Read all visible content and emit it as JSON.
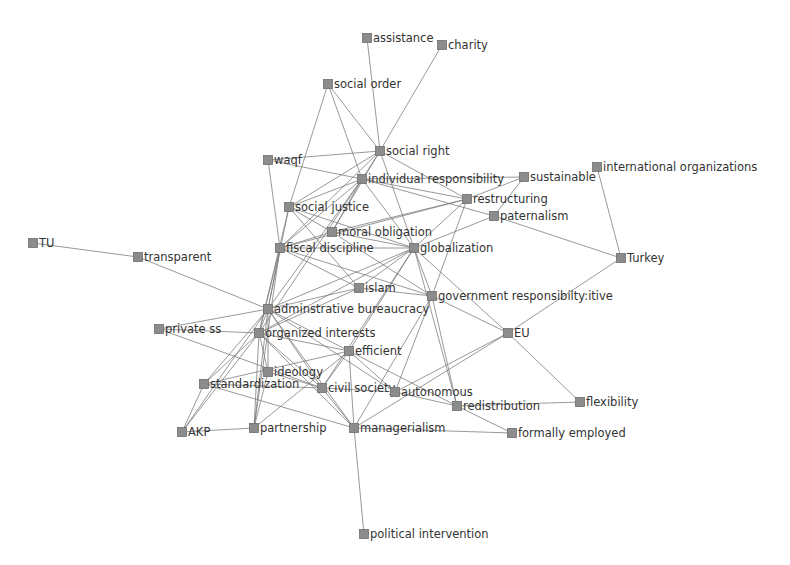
{
  "diagram": {
    "type": "network",
    "node_color": "#8c8c8c",
    "edge_color": "#7a7a7a",
    "label_color": "#333333",
    "nodes": [
      {
        "id": "assistance",
        "label": "assistance",
        "x": 367,
        "y": 38
      },
      {
        "id": "charity",
        "label": "charity",
        "x": 442,
        "y": 45
      },
      {
        "id": "social_order",
        "label": "social order",
        "x": 328,
        "y": 84
      },
      {
        "id": "social_right",
        "label": "social right",
        "x": 380,
        "y": 151
      },
      {
        "id": "waqf",
        "label": "waqf",
        "x": 268,
        "y": 160
      },
      {
        "id": "individual_responsibility",
        "label": "individual responsibility",
        "x": 362,
        "y": 179
      },
      {
        "id": "sustainable",
        "label": "sustainable",
        "x": 524,
        "y": 177
      },
      {
        "id": "international_organizations",
        "label": "international organizations",
        "x": 597,
        "y": 167
      },
      {
        "id": "restructuring",
        "label": "restructuring",
        "x": 467,
        "y": 199
      },
      {
        "id": "paternalism",
        "label": "paternalism",
        "x": 494,
        "y": 216
      },
      {
        "id": "social_justice",
        "label": "social justice",
        "x": 289,
        "y": 207
      },
      {
        "id": "moral_obligation",
        "label": "moral obligation",
        "x": 332,
        "y": 232
      },
      {
        "id": "fiscal_discipline",
        "label": "fiscal discipline",
        "x": 280,
        "y": 248
      },
      {
        "id": "globalization",
        "label": "globalization",
        "x": 414,
        "y": 248
      },
      {
        "id": "tu",
        "label": "TU",
        "x": 33,
        "y": 243
      },
      {
        "id": "transparent",
        "label": "transparent",
        "x": 138,
        "y": 257
      },
      {
        "id": "turkey",
        "label": "Turkey",
        "x": 621,
        "y": 258
      },
      {
        "id": "islam",
        "label": "islam",
        "x": 359,
        "y": 288
      },
      {
        "id": "adminstrative_bureaucracy",
        "label": "adminstrative bureaucracy",
        "x": 268,
        "y": 309
      },
      {
        "id": "government_responsibility",
        "label": "government responsibilty:itive",
        "x": 432,
        "y": 296
      },
      {
        "id": "private_ss",
        "label": "private ss",
        "x": 159,
        "y": 329
      },
      {
        "id": "organized_interests",
        "label": "organized interests",
        "x": 259,
        "y": 333
      },
      {
        "id": "eu",
        "label": "EU",
        "x": 508,
        "y": 333
      },
      {
        "id": "efficient",
        "label": "efficient",
        "x": 349,
        "y": 351
      },
      {
        "id": "ideology",
        "label": "ideology",
        "x": 268,
        "y": 372
      },
      {
        "id": "standardization",
        "label": "standardization",
        "x": 204,
        "y": 384
      },
      {
        "id": "civil_society",
        "label": "civil society",
        "x": 322,
        "y": 388
      },
      {
        "id": "autonomous",
        "label": "autonomous",
        "x": 395,
        "y": 392
      },
      {
        "id": "redistribution",
        "label": "redistribution",
        "x": 457,
        "y": 406
      },
      {
        "id": "flexibility",
        "label": "flexibility",
        "x": 580,
        "y": 402
      },
      {
        "id": "akp",
        "label": "AKP",
        "x": 182,
        "y": 432
      },
      {
        "id": "partnership",
        "label": "partnership",
        "x": 254,
        "y": 428
      },
      {
        "id": "managerialism",
        "label": "managerialism",
        "x": 354,
        "y": 428
      },
      {
        "id": "formally_employed",
        "label": "formally employed",
        "x": 512,
        "y": 433
      },
      {
        "id": "political_intervention",
        "label": "political intervention",
        "x": 364,
        "y": 534
      }
    ],
    "edges": [
      [
        "assistance",
        "social_right"
      ],
      [
        "charity",
        "social_right"
      ],
      [
        "social_order",
        "social_right"
      ],
      [
        "social_order",
        "individual_responsibility"
      ],
      [
        "social_order",
        "social_justice"
      ],
      [
        "waqf",
        "social_right"
      ],
      [
        "waqf",
        "individual_responsibility"
      ],
      [
        "waqf",
        "fiscal_discipline"
      ],
      [
        "social_right",
        "individual_responsibility"
      ],
      [
        "social_right",
        "social_justice"
      ],
      [
        "social_right",
        "restructuring"
      ],
      [
        "social_right",
        "moral_obligation"
      ],
      [
        "social_right",
        "globalization"
      ],
      [
        "social_right",
        "fiscal_discipline"
      ],
      [
        "individual_responsibility",
        "social_justice"
      ],
      [
        "individual_responsibility",
        "restructuring"
      ],
      [
        "individual_responsibility",
        "paternalism"
      ],
      [
        "individual_responsibility",
        "sustainable"
      ],
      [
        "individual_responsibility",
        "moral_obligation"
      ],
      [
        "individual_responsibility",
        "fiscal_discipline"
      ],
      [
        "individual_responsibility",
        "globalization"
      ],
      [
        "individual_responsibility",
        "adminstrative_bureaucracy"
      ],
      [
        "individual_responsibility",
        "organized_interests"
      ],
      [
        "sustainable",
        "restructuring"
      ],
      [
        "sustainable",
        "paternalism"
      ],
      [
        "international_organizations",
        "turkey"
      ],
      [
        "restructuring",
        "globalization"
      ],
      [
        "restructuring",
        "fiscal_discipline"
      ],
      [
        "restructuring",
        "government_responsibility"
      ],
      [
        "restructuring",
        "moral_obligation"
      ],
      [
        "paternalism",
        "globalization"
      ],
      [
        "paternalism",
        "turkey"
      ],
      [
        "social_justice",
        "moral_obligation"
      ],
      [
        "social_justice",
        "globalization"
      ],
      [
        "social_justice",
        "islam"
      ],
      [
        "social_justice",
        "adminstrative_bureaucracy"
      ],
      [
        "social_justice",
        "organized_interests"
      ],
      [
        "moral_obligation",
        "globalization"
      ],
      [
        "moral_obligation",
        "fiscal_discipline"
      ],
      [
        "moral_obligation",
        "government_responsibility"
      ],
      [
        "fiscal_discipline",
        "globalization"
      ],
      [
        "fiscal_discipline",
        "islam"
      ],
      [
        "fiscal_discipline",
        "adminstrative_bureaucracy"
      ],
      [
        "fiscal_discipline",
        "organized_interests"
      ],
      [
        "fiscal_discipline",
        "partnership"
      ],
      [
        "fiscal_discipline",
        "government_responsibility"
      ],
      [
        "globalization",
        "islam"
      ],
      [
        "globalization",
        "government_responsibility"
      ],
      [
        "globalization",
        "adminstrative_bureaucracy"
      ],
      [
        "globalization",
        "organized_interests"
      ],
      [
        "globalization",
        "efficient"
      ],
      [
        "globalization",
        "eu"
      ],
      [
        "globalization",
        "redistribution"
      ],
      [
        "globalization",
        "civil_society"
      ],
      [
        "tu",
        "transparent"
      ],
      [
        "transparent",
        "adminstrative_bureaucracy"
      ],
      [
        "turkey",
        "eu"
      ],
      [
        "islam",
        "adminstrative_bureaucracy"
      ],
      [
        "islam",
        "organized_interests"
      ],
      [
        "islam",
        "government_responsibility"
      ],
      [
        "adminstrative_bureaucracy",
        "organized_interests"
      ],
      [
        "adminstrative_bureaucracy",
        "efficient"
      ],
      [
        "adminstrative_bureaucracy",
        "ideology"
      ],
      [
        "adminstrative_bureaucracy",
        "standardization"
      ],
      [
        "adminstrative_bureaucracy",
        "civil_society"
      ],
      [
        "adminstrative_bureaucracy",
        "partnership"
      ],
      [
        "adminstrative_bureaucracy",
        "private_ss"
      ],
      [
        "adminstrative_bureaucracy",
        "managerialism"
      ],
      [
        "adminstrative_bureaucracy",
        "akp"
      ],
      [
        "adminstrative_bureaucracy",
        "autonomous"
      ],
      [
        "government_responsibility",
        "eu"
      ],
      [
        "government_responsibility",
        "redistribution"
      ],
      [
        "government_responsibility",
        "managerialism"
      ],
      [
        "government_responsibility",
        "autonomous"
      ],
      [
        "private_ss",
        "organized_interests"
      ],
      [
        "private_ss",
        "civil_society"
      ],
      [
        "organized_interests",
        "efficient"
      ],
      [
        "organized_interests",
        "ideology"
      ],
      [
        "organized_interests",
        "standardization"
      ],
      [
        "organized_interests",
        "civil_society"
      ],
      [
        "organized_interests",
        "partnership"
      ],
      [
        "organized_interests",
        "managerialism"
      ],
      [
        "organized_interests",
        "akp"
      ],
      [
        "eu",
        "flexibility"
      ],
      [
        "eu",
        "autonomous"
      ],
      [
        "eu",
        "managerialism"
      ],
      [
        "efficient",
        "civil_society"
      ],
      [
        "efficient",
        "standardization"
      ],
      [
        "efficient",
        "autonomous"
      ],
      [
        "efficient",
        "managerialism"
      ],
      [
        "efficient",
        "partnership"
      ],
      [
        "efficient",
        "redistribution"
      ],
      [
        "ideology",
        "civil_society"
      ],
      [
        "ideology",
        "partnership"
      ],
      [
        "standardization",
        "civil_society"
      ],
      [
        "standardization",
        "akp"
      ],
      [
        "standardization",
        "managerialism"
      ],
      [
        "civil_society",
        "managerialism"
      ],
      [
        "civil_society",
        "autonomous"
      ],
      [
        "autonomous",
        "redistribution"
      ],
      [
        "redistribution",
        "flexibility"
      ],
      [
        "redistribution",
        "formally_employed"
      ],
      [
        "managerialism",
        "formally_employed"
      ],
      [
        "akp",
        "partnership"
      ],
      [
        "managerialism",
        "political_intervention"
      ]
    ]
  }
}
